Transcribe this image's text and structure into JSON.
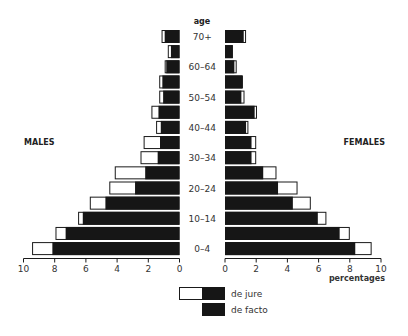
{
  "chart_data": {
    "type": "bar",
    "subtype": "population-pyramid",
    "title": "",
    "age_axis_label": "age",
    "xlabel": "percentages",
    "left_label": "MALES",
    "right_label": "FEMALES",
    "xlim": [
      0,
      10
    ],
    "x_ticks": [
      0,
      2,
      4,
      6,
      8,
      10
    ],
    "x_tick_labels": [
      "0",
      "2",
      "4",
      "6",
      "8",
      "10"
    ],
    "grid": false,
    "legend_position": "bottom-center",
    "categories": [
      "70+",
      "65-69",
      "60-64",
      "55-59",
      "50-54",
      "45-49",
      "40-44",
      "35-39",
      "30-34",
      "25-29",
      "20-24",
      "15-19",
      "10-14",
      "5-9",
      "0-4"
    ],
    "visible_category_labels": [
      "70+",
      "",
      "60-64",
      "",
      "50-54",
      "",
      "40-44",
      "",
      "30-34",
      "",
      "20-24",
      "",
      "10-14",
      "",
      "0-4"
    ],
    "series": [
      {
        "name": "males de jure",
        "side": "left",
        "values": [
          1.15,
          0.75,
          0.95,
          1.3,
          1.3,
          1.8,
          1.5,
          2.3,
          2.5,
          4.15,
          4.5,
          5.75,
          6.5,
          7.95,
          9.45
        ]
      },
      {
        "name": "males de facto",
        "side": "left",
        "values": [
          0.95,
          0.55,
          0.85,
          1.1,
          1.05,
          1.35,
          1.2,
          1.25,
          1.4,
          2.2,
          2.85,
          4.75,
          6.2,
          7.3,
          8.15
        ]
      },
      {
        "name": "females de jure",
        "side": "right",
        "values": [
          1.35,
          0.5,
          0.75,
          1.15,
          1.25,
          2.05,
          1.5,
          2.0,
          2.0,
          3.3,
          4.65,
          5.5,
          6.5,
          8.0,
          9.4
        ]
      },
      {
        "name": "females de facto",
        "side": "right",
        "values": [
          1.2,
          0.5,
          0.6,
          1.1,
          1.05,
          1.9,
          1.35,
          1.7,
          1.7,
          2.45,
          3.4,
          4.35,
          5.95,
          7.35,
          8.35
        ]
      }
    ],
    "legend": [
      {
        "label": "de jure",
        "style": "white + black combined bar"
      },
      {
        "label": "de facto",
        "style": "black bar"
      }
    ]
  },
  "colors": {
    "de_facto_fill": "#161616",
    "de_jure_fill": "#ffffff",
    "outline": "#1a1a1a",
    "text": "#333333"
  }
}
